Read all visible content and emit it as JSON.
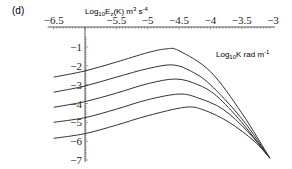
{
  "panel_label": "(d)",
  "chart_data": {
    "type": "line",
    "title": "",
    "panel": "(d)",
    "ylabel": "Log10 Ez(K) m3 s-4",
    "ylabel_parts": {
      "base": "Log",
      "sub1": "10",
      "mid": "E",
      "sub2": "z",
      "rest": "(K)  m",
      "sup1": "3",
      "rest2": " s",
      "sup2": "-4"
    },
    "xlabel": "Log10 K rad m-1",
    "xlabel_parts": {
      "base": "Log",
      "sub": "10",
      "rest": "K  rad m",
      "sup": "-1"
    },
    "xlim": [
      -6.5,
      -3
    ],
    "ylim": [
      -7,
      -0.5
    ],
    "x_ticks": [
      -6.5,
      -5.5,
      -5,
      -4.5,
      -4,
      -3.5,
      -3
    ],
    "x_tick_labels": [
      "−6.5",
      "−5.5",
      "−5",
      "−4.5",
      "−4",
      "−3.5",
      "−3"
    ],
    "y_ticks": [
      -1,
      -2,
      -3,
      -4,
      -5,
      -6,
      -7
    ],
    "y_tick_labels": [
      "−1",
      "−2",
      "−3",
      "−4",
      "−5",
      "−6",
      "−7"
    ],
    "x_axis_position": "top",
    "y_axis_crosses_x": -6,
    "grid": false,
    "legend": null,
    "line_color": "#333333",
    "series": [
      {
        "name": "curve 1",
        "x": [
          -6.5,
          -6,
          -5.5,
          -5,
          -4.7,
          -4.5,
          -4,
          -3.5,
          -3.05
        ],
        "y": [
          -2.6,
          -2.27,
          -1.8,
          -1.3,
          -1.1,
          -1.2,
          -2.3,
          -4.5,
          -6.9
        ]
      },
      {
        "name": "curve 2",
        "x": [
          -6.5,
          -6,
          -5.5,
          -5,
          -4.6,
          -4.3,
          -4,
          -3.5,
          -3.05
        ],
        "y": [
          -3.4,
          -3.07,
          -2.6,
          -2.15,
          -1.95,
          -2.3,
          -3.0,
          -4.8,
          -6.9
        ]
      },
      {
        "name": "curve 3",
        "x": [
          -6.5,
          -6,
          -5.5,
          -5,
          -4.55,
          -4.2,
          -3.9,
          -3.5,
          -3.05
        ],
        "y": [
          -4.2,
          -3.9,
          -3.45,
          -2.95,
          -2.7,
          -3.0,
          -3.6,
          -5.0,
          -6.9
        ]
      },
      {
        "name": "curve 4",
        "x": [
          -6.5,
          -6,
          -5.5,
          -5,
          -4.5,
          -4.2,
          -3.8,
          -3.4,
          -3.05
        ],
        "y": [
          -5.0,
          -4.75,
          -4.3,
          -3.8,
          -3.5,
          -3.7,
          -4.3,
          -5.5,
          -6.9
        ]
      },
      {
        "name": "curve 5",
        "x": [
          -6.5,
          -6,
          -5.5,
          -5,
          -4.4,
          -4.1,
          -3.7,
          -3.3,
          -3.05
        ],
        "y": [
          -5.85,
          -5.6,
          -5.15,
          -4.65,
          -4.2,
          -4.35,
          -5.0,
          -6.0,
          -6.9
        ]
      }
    ]
  }
}
